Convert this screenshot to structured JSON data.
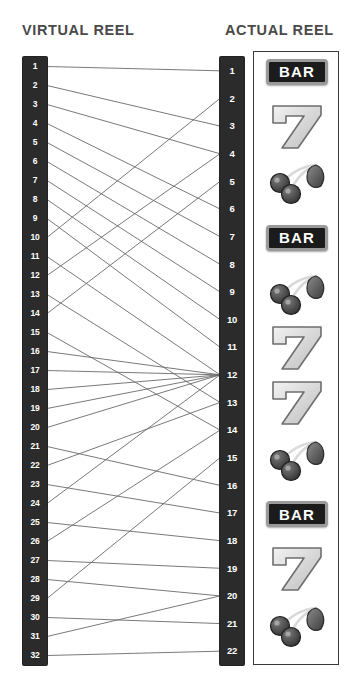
{
  "headers": {
    "virtual": "VIRTUAL REEL",
    "actual": "ACTUAL REEL"
  },
  "colors": {
    "reel_fill": "#2b2b2b",
    "reel_text": "#ffffff",
    "wire": "#6a6a6a",
    "panel_border": "#3a3a3a",
    "header_text": "#4a4a4a",
    "bar_badge_fill": "#1b1b1b",
    "bar_badge_border": "#9a9a9a",
    "seven_fill": "#d6d6d6",
    "cherry_fill": "#4a4a4a"
  },
  "virtual_reel": {
    "count": 32,
    "stops": [
      "1",
      "2",
      "3",
      "4",
      "5",
      "6",
      "7",
      "8",
      "9",
      "10",
      "11",
      "12",
      "13",
      "14",
      "15",
      "16",
      "17",
      "18",
      "19",
      "20",
      "21",
      "22",
      "23",
      "24",
      "25",
      "26",
      "27",
      "28",
      "29",
      "30",
      "31",
      "32"
    ]
  },
  "actual_reel": {
    "count": 22,
    "stops": [
      "1",
      "2",
      "3",
      "4",
      "5",
      "6",
      "7",
      "8",
      "9",
      "10",
      "11",
      "12",
      "13",
      "14",
      "15",
      "16",
      "17",
      "18",
      "19",
      "20",
      "21",
      "22"
    ]
  },
  "symbols": [
    {
      "index": 1,
      "name": "BAR",
      "label": "BAR",
      "actual_stop": 1
    },
    {
      "index": 2,
      "name": "seven",
      "label": "7",
      "actual_stop": 3
    },
    {
      "index": 3,
      "name": "cherry",
      "label": "",
      "actual_stop": 5
    },
    {
      "index": 4,
      "name": "BAR",
      "label": "BAR",
      "actual_stop": 7
    },
    {
      "index": 5,
      "name": "cherry",
      "label": "",
      "actual_stop": 9
    },
    {
      "index": 6,
      "name": "seven",
      "label": "7",
      "actual_stop": 11
    },
    {
      "index": 7,
      "name": "seven",
      "label": "7",
      "actual_stop": 13
    },
    {
      "index": 8,
      "name": "cherry",
      "label": "",
      "actual_stop": 15
    },
    {
      "index": 9,
      "name": "BAR",
      "label": "BAR",
      "actual_stop": 17
    },
    {
      "index": 10,
      "name": "seven",
      "label": "7",
      "actual_stop": 19
    },
    {
      "index": 11,
      "name": "cherry",
      "label": "",
      "actual_stop": 21
    }
  ],
  "mapping": [
    {
      "virtual": 1,
      "actual": 1
    },
    {
      "virtual": 2,
      "actual": 3
    },
    {
      "virtual": 3,
      "actual": 4
    },
    {
      "virtual": 4,
      "actual": 6
    },
    {
      "virtual": 5,
      "actual": 7
    },
    {
      "virtual": 6,
      "actual": 8
    },
    {
      "virtual": 7,
      "actual": 9
    },
    {
      "virtual": 8,
      "actual": 10
    },
    {
      "virtual": 9,
      "actual": 11
    },
    {
      "virtual": 10,
      "actual": 2
    },
    {
      "virtual": 11,
      "actual": 12
    },
    {
      "virtual": 12,
      "actual": 4
    },
    {
      "virtual": 13,
      "actual": 13
    },
    {
      "virtual": 14,
      "actual": 5
    },
    {
      "virtual": 15,
      "actual": 14
    },
    {
      "virtual": 16,
      "actual": 12
    },
    {
      "virtual": 17,
      "actual": 12
    },
    {
      "virtual": 18,
      "actual": 12
    },
    {
      "virtual": 19,
      "actual": 12
    },
    {
      "virtual": 20,
      "actual": 12
    },
    {
      "virtual": 21,
      "actual": 16
    },
    {
      "virtual": 22,
      "actual": 13
    },
    {
      "virtual": 23,
      "actual": 17
    },
    {
      "virtual": 24,
      "actual": 12
    },
    {
      "virtual": 25,
      "actual": 18
    },
    {
      "virtual": 26,
      "actual": 14
    },
    {
      "virtual": 27,
      "actual": 19
    },
    {
      "virtual": 28,
      "actual": 20
    },
    {
      "virtual": 29,
      "actual": 15
    },
    {
      "virtual": 30,
      "actual": 21
    },
    {
      "virtual": 31,
      "actual": 20
    },
    {
      "virtual": 32,
      "actual": 22
    }
  ]
}
